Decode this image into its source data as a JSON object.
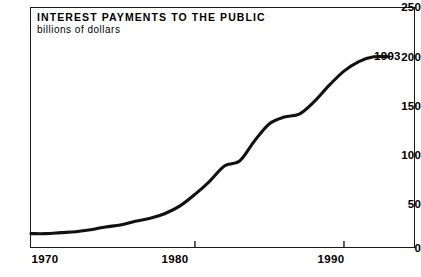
{
  "chart_data": {
    "type": "line",
    "title": "INTEREST PAYMENTS TO THE PUBLIC",
    "subtitle": "billions of dollars",
    "xlabel": "",
    "ylabel": "billions of dollars",
    "xlim": [
      1969,
      1994.7
    ],
    "ylim": [
      0,
      250
    ],
    "grid": false,
    "legend_position": "none",
    "y_ticks": [
      250,
      200,
      150,
      100,
      50,
      0
    ],
    "y_tick_labels": [
      "250",
      "200",
      "150",
      "100",
      "50",
      "0"
    ],
    "x_ticks": [
      1970,
      1980,
      1990
    ],
    "x_tick_labels": [
      "1970",
      "1980",
      "1990"
    ],
    "annotations": [
      {
        "text": "1993",
        "x": 1993,
        "y": 199
      }
    ],
    "series": [
      {
        "name": "Interest payments to the public",
        "color": "#111111",
        "x": [
          1969,
          1970,
          1971,
          1972,
          1973,
          1974,
          1975,
          1976,
          1977,
          1978,
          1979,
          1980,
          1981,
          1982,
          1983,
          1984,
          1985,
          1986,
          1987,
          1988,
          1989,
          1990,
          1991,
          1992,
          1993
        ],
        "values": [
          14,
          14,
          15,
          16,
          18,
          21,
          23,
          27,
          30,
          35,
          43,
          55,
          69,
          85,
          90,
          111,
          129,
          136,
          139,
          152,
          169,
          184,
          194,
          199,
          199
        ]
      }
    ]
  }
}
